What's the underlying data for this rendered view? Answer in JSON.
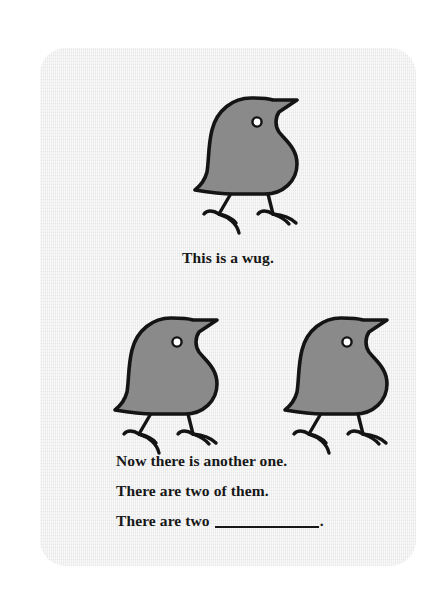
{
  "card": {
    "background_color": "#ececec",
    "page_background_color": "#ffffff"
  },
  "figure": {
    "icon_name": "wug-bird",
    "fill_color": "#8a8a8a",
    "outline_color": "#141414",
    "eye_color": "#ffffff",
    "count_top": 1,
    "count_bottom": 2
  },
  "captions": {
    "single": "This is a wug.",
    "line_1": "Now there is another one.",
    "line_2": "There are two of them.",
    "line_3_prefix": "There are two",
    "line_3_blank": "__________",
    "line_3_suffix": "."
  }
}
